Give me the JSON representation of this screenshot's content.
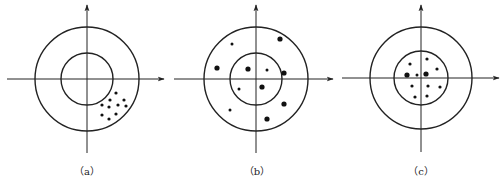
{
  "diagram": {
    "stroke_color": "#222222",
    "panels": [
      {
        "id": "a",
        "label": "（a）",
        "center": [
          87,
          79
        ],
        "outer_radius": 52,
        "inner_radius": 26,
        "h_axis": [
          7,
          164
        ],
        "v_axis": [
          5,
          153
        ],
        "label_pos": [
          87,
          175
        ],
        "dots": [
          [
            116,
            93,
            1.6
          ],
          [
            110,
            100,
            1.6
          ],
          [
            124,
            100,
            1.6
          ],
          [
            102,
            105,
            1.6
          ],
          [
            109,
            107,
            1.6
          ],
          [
            118,
            105,
            1.6
          ],
          [
            126,
            106,
            1.6
          ],
          [
            102,
            115,
            1.6
          ],
          [
            116,
            114,
            1.6
          ],
          [
            109,
            119,
            1.6
          ]
        ]
      },
      {
        "id": "b",
        "label": "（b）",
        "center": [
          256,
          79
        ],
        "outer_radius": 52,
        "inner_radius": 26,
        "h_axis": [
          174,
          333
        ],
        "v_axis": [
          5,
          153
        ],
        "label_pos": [
          257,
          175
        ],
        "dots": [
          [
            280,
            39,
            2.6
          ],
          [
            232,
            44,
            1.5
          ],
          [
            217,
            68,
            2.6
          ],
          [
            248,
            69,
            2.6
          ],
          [
            267,
            70,
            1.5
          ],
          [
            284,
            73,
            2.6
          ],
          [
            239,
            89,
            1.5
          ],
          [
            262,
            87,
            2.6
          ],
          [
            230,
            110,
            1.5
          ],
          [
            284,
            104,
            2.6
          ],
          [
            267,
            119,
            2.6
          ]
        ]
      },
      {
        "id": "c",
        "label": "（c）",
        "center": [
          421,
          78
        ],
        "outer_radius": 51,
        "inner_radius": 27,
        "h_axis": [
          342,
          499
        ],
        "v_axis": [
          5,
          152
        ],
        "label_pos": [
          421,
          175
        ],
        "dots": [
          [
            410,
            64,
            1.6
          ],
          [
            427,
            59,
            1.6
          ],
          [
            437,
            69,
            1.6
          ],
          [
            407,
            75,
            2.6
          ],
          [
            417,
            75,
            1.5
          ],
          [
            426,
            74,
            2.6
          ],
          [
            412,
            86,
            1.6
          ],
          [
            428,
            86,
            1.6
          ],
          [
            440,
            87,
            1.6
          ],
          [
            415,
            97,
            1.6
          ],
          [
            427,
            96,
            1.6
          ]
        ]
      }
    ]
  }
}
